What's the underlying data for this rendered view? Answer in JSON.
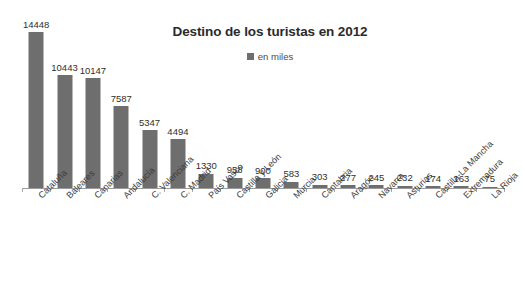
{
  "chart_data": {
    "type": "bar",
    "title": "Destino de los turistas en 2012",
    "xlabel": "",
    "ylabel": "",
    "ylim": [
      0,
      14448
    ],
    "grid": false,
    "legend_position": "top-center",
    "legend": [
      "en miles"
    ],
    "series_name": "en miles",
    "bar_color": "#6E6E6E",
    "categories": [
      "Cataluña",
      "Baleares",
      "Canarias",
      "Andalucía",
      "C. Valenciana",
      "C. Madrid",
      "País Vasco",
      "Castilla y León",
      "Galicia",
      "Murcia",
      "Cantabria",
      "Aragón",
      "Navarra",
      "Asturias",
      "Castilla-La Mancha",
      "Extremadura",
      "La Rioja"
    ],
    "values": [
      14448,
      10443,
      10147,
      7587,
      5347,
      4494,
      1330,
      958,
      900,
      583,
      303,
      277,
      245,
      232,
      174,
      163,
      75
    ],
    "value_labels": [
      "14448",
      "10443",
      "10147",
      "7587",
      "5347",
      "4494",
      "1330",
      "958",
      "900",
      "583",
      "303",
      "277",
      "245",
      "232",
      "174",
      "163",
      "75"
    ]
  },
  "colors": {
    "bar": "#6E6E6E",
    "axis": "#9a9a9a",
    "title": "#2b2b2b",
    "text": "#3a3a3a",
    "background": "#ffffff"
  }
}
